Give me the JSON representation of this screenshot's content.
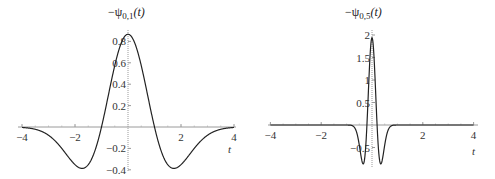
{
  "colors": {
    "curve": "#222222",
    "axis": "#999999",
    "text": "#333333",
    "background": "#ffffff"
  },
  "chart_data": [
    {
      "type": "line",
      "title": "−ψ0,1(t)",
      "title_parts": {
        "prefix": "−ψ",
        "sub": "0,1",
        "suffix": "(t)"
      },
      "xlabel": "t",
      "ylabel": "",
      "xlim": [
        -4,
        4
      ],
      "ylim": [
        -0.4,
        0.87
      ],
      "x_ticks": [
        -4,
        -2,
        2,
        4
      ],
      "x_tick_labels": [
        "−4",
        "−2",
        "2",
        "4"
      ],
      "y_ticks": [
        0.8,
        0.6,
        0.4,
        0.2,
        -0.2,
        -0.4
      ],
      "y_tick_labels": [
        "0.8",
        "0.6",
        "0.4",
        "0.2",
        "−0.2",
        "−0.4"
      ],
      "grid": false,
      "scale": 1.0,
      "peak": {
        "t": 0,
        "value": 0.867
      },
      "minima": [
        {
          "t": -1.73,
          "value": -0.387
        },
        {
          "t": 1.73,
          "value": -0.387
        }
      ],
      "x": [
        -4,
        -3.5,
        -3,
        -2.5,
        -2,
        -1.732,
        -1.5,
        -1,
        -0.5,
        0,
        0.5,
        1,
        1.5,
        1.732,
        2,
        2.5,
        3,
        3.5,
        4
      ],
      "values": [
        -0.0043,
        -0.0232,
        -0.0769,
        -0.1918,
        -0.3518,
        -0.3867,
        -0.3523,
        0,
        0.5736,
        0.867,
        0.5736,
        0,
        -0.3523,
        -0.3867,
        -0.3518,
        -0.1918,
        -0.0769,
        -0.0232,
        -0.0043
      ]
    },
    {
      "type": "line",
      "title": "−ψ0,5(t)",
      "title_parts": {
        "prefix": "−ψ",
        "sub": "0,5",
        "suffix": "(t)"
      },
      "xlabel": "t",
      "ylabel": "",
      "xlim": [
        -4,
        4
      ],
      "ylim": [
        -0.87,
        1.94
      ],
      "x_ticks": [
        -4,
        -2,
        2,
        4
      ],
      "x_tick_labels": [
        "−4",
        "−2",
        "2",
        "4"
      ],
      "y_ticks": [
        2,
        1.5,
        1,
        0.5,
        -0.5
      ],
      "y_tick_labels": [
        "2",
        "1.5",
        "1",
        "0.5",
        "−0.5"
      ],
      "grid": false,
      "scale": 0.2,
      "peak": {
        "t": 0,
        "value": 1.94
      },
      "minima": [
        {
          "t": -0.35,
          "value": -0.87
        },
        {
          "t": 0.35,
          "value": -0.87
        }
      ],
      "x": [
        -4,
        -1,
        -0.8,
        -0.6,
        -0.5,
        -0.4,
        -0.346,
        -0.3,
        -0.2,
        -0.1,
        0,
        0.1,
        0.2,
        0.3,
        0.346,
        0.4,
        0.5,
        0.6,
        0.8,
        1,
        4
      ],
      "values": [
        0,
        -0.0805,
        -0.224,
        -0.5021,
        -0.6708,
        -0.8177,
        -0.8651,
        -0.8093,
        0,
        1.2806,
        1.9387,
        1.2806,
        0,
        -0.8093,
        -0.8651,
        -0.8177,
        -0.6708,
        -0.5021,
        -0.224,
        -0.0805,
        0
      ]
    }
  ]
}
